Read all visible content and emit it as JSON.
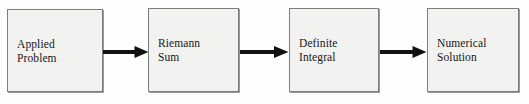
{
  "diagram": {
    "type": "flowchart",
    "title": "",
    "orientation": "left-to-right",
    "colors": {
      "page_background": "#fefefe",
      "node_fill": "#f2f2f0",
      "node_border": "#7c7c7c",
      "node_shadow": "#9a9a9a",
      "text": "#181818",
      "arrow": "#111111"
    },
    "nodes": [
      {
        "id": "node-0",
        "label": "Applied\nProblem",
        "line1": "Applied",
        "line2": "Problem"
      },
      {
        "id": "node-1",
        "label": "Riemann\nSum",
        "line1": "Riemann",
        "line2": "Sum"
      },
      {
        "id": "node-2",
        "label": "Definite\nIntegral",
        "line1": "Definite",
        "line2": "Integral"
      },
      {
        "id": "node-3",
        "label": "Numerical\nSolution",
        "line1": "Numerical",
        "line2": "Solution"
      }
    ],
    "arrows": [
      {
        "id": "arrow-0",
        "icon": "arrow-right-icon",
        "from": "node-0",
        "to": "node-1",
        "label": ""
      },
      {
        "id": "arrow-1",
        "icon": "arrow-right-icon",
        "from": "node-1",
        "to": "node-2",
        "label": ""
      },
      {
        "id": "arrow-2",
        "icon": "arrow-right-icon",
        "from": "node-2",
        "to": "node-3",
        "label": ""
      }
    ]
  }
}
